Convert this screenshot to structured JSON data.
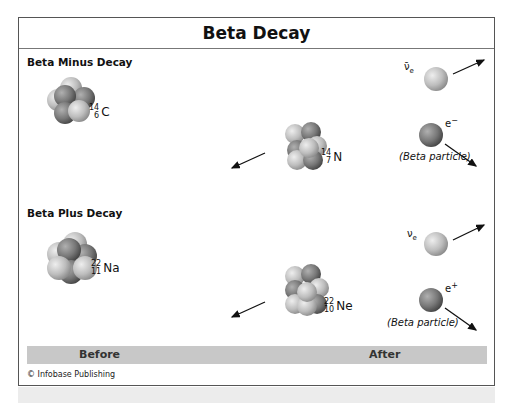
{
  "title": "Beta Decay",
  "sections": [
    {
      "label": "Beta Minus Decay",
      "before": {
        "mass": "14",
        "atomic": "6",
        "symbol": "C"
      },
      "after": {
        "mass": "14",
        "atomic": "7",
        "symbol": "N"
      },
      "neutrino": {
        "symbol": "ν̄",
        "sub": "e"
      },
      "particle": {
        "symbol": "e",
        "charge": "−",
        "caption": "(Beta particle)"
      }
    },
    {
      "label": "Beta Plus Decay",
      "before": {
        "mass": "22",
        "atomic": "11",
        "symbol": "Na"
      },
      "after": {
        "mass": "22",
        "atomic": "10",
        "symbol": "Ne"
      },
      "neutrino": {
        "symbol": "ν",
        "sub": "e"
      },
      "particle": {
        "symbol": "e",
        "charge": "+",
        "caption": "(Beta particle)"
      }
    }
  ],
  "footer_bar": {
    "before": "Before",
    "after": "After"
  },
  "credit": "© Infobase Publishing",
  "colors": {
    "frame": "#555555",
    "bar": "#c8c8c8",
    "nucleon_light": "#d0d0d0",
    "nucleon_dark": "#7a7a7a"
  }
}
